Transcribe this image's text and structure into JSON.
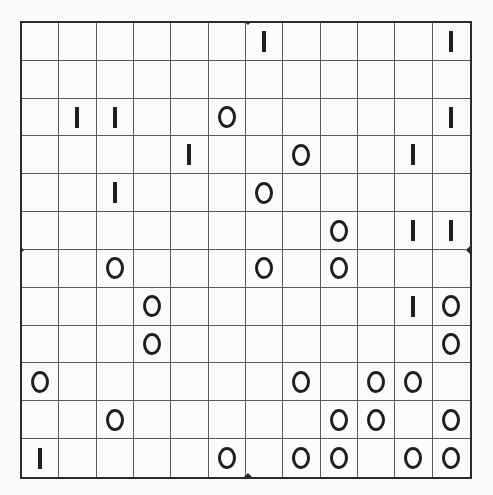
{
  "puzzle": {
    "type": "binary-puzzle",
    "rows": 12,
    "cols": 12,
    "symbols": {
      "one": "I",
      "zero": "0"
    },
    "grid": [
      [
        "",
        "",
        "",
        "",
        "",
        "",
        "1",
        "",
        "",
        "",
        "",
        "1"
      ],
      [
        "",
        "",
        "",
        "",
        "",
        "",
        "",
        "",
        "",
        "",
        "",
        ""
      ],
      [
        "",
        "1",
        "1",
        "",
        "",
        "0",
        "",
        "",
        "",
        "",
        "",
        "1"
      ],
      [
        "",
        "",
        "",
        "",
        "1",
        "",
        "",
        "0",
        "",
        "",
        "1",
        ""
      ],
      [
        "",
        "",
        "1",
        "",
        "",
        "",
        "0",
        "",
        "",
        "",
        "",
        ""
      ],
      [
        "",
        "",
        "",
        "",
        "",
        "",
        "",
        "",
        "0",
        "",
        "1",
        "1"
      ],
      [
        "",
        "",
        "0",
        "",
        "",
        "",
        "0",
        "",
        "0",
        "",
        "",
        ""
      ],
      [
        "",
        "",
        "",
        "0",
        "",
        "",
        "",
        "",
        "",
        "",
        "1",
        "0"
      ],
      [
        "",
        "",
        "",
        "0",
        "",
        "",
        "",
        "",
        "",
        "",
        "",
        "0"
      ],
      [
        "0",
        "",
        "",
        "",
        "",
        "",
        "",
        "0",
        "",
        "0",
        "0",
        ""
      ],
      [
        "",
        "",
        "0",
        "",
        "",
        "",
        "",
        "",
        "0",
        "0",
        "",
        "0"
      ],
      [
        "1",
        "",
        "",
        "",
        "",
        "0",
        "",
        "0",
        "0",
        "",
        "0",
        "0"
      ]
    ]
  },
  "colors": {
    "ink": "#1e1e1e",
    "grid_line": "#5a5a5a",
    "border": "#2a2a2a",
    "background": "#fbfbfb"
  }
}
